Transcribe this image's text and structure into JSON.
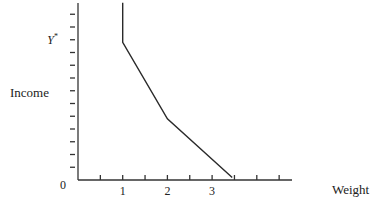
{
  "chart_data": {
    "type": "line",
    "title": "",
    "xlabel": "Weight",
    "ylabel": "Income",
    "origin_label": "0",
    "xlim": [
      0,
      4.8
    ],
    "ylim": [
      0,
      14
    ],
    "x_ticks": [
      0.5,
      1,
      1.5,
      2,
      2.5,
      3,
      3.5,
      4,
      4.5
    ],
    "x_tick_labels": [
      {
        "value": 1,
        "label": "1"
      },
      {
        "value": 2,
        "label": "2"
      },
      {
        "value": 3,
        "label": "3"
      }
    ],
    "y_ticks": [
      1,
      2,
      3,
      4,
      5,
      6,
      7,
      8,
      9,
      10,
      11,
      12,
      13
    ],
    "y_annotations": [
      {
        "value": 11,
        "label": "Y",
        "superscript": "*"
      }
    ],
    "grid": false,
    "legend": "none",
    "series": [
      {
        "name": "income-weight schedule",
        "x": [
          1,
          1,
          2,
          3.45
        ],
        "y": [
          13.9,
          10.8,
          4.8,
          0.2
        ]
      }
    ]
  }
}
